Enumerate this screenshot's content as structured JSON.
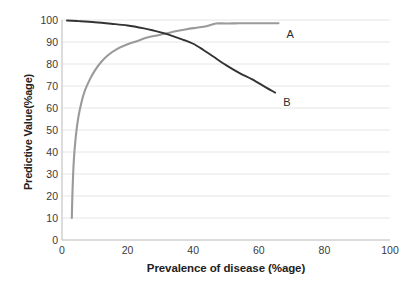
{
  "chart_data": {
    "type": "line",
    "title": "",
    "xlabel": "Prevalence of disease (%age)",
    "ylabel": "Predictive Value(%age)",
    "xlim": [
      0,
      100
    ],
    "ylim": [
      0,
      100
    ],
    "grid": "horizontal",
    "legend_position": "inline-end-of-line",
    "xticks": [
      0,
      20,
      40,
      60,
      80,
      100
    ],
    "yticks": [
      0,
      10,
      20,
      30,
      40,
      50,
      60,
      70,
      80,
      90,
      100
    ],
    "series": [
      {
        "name": "A",
        "label": "A",
        "color": "#9a9a9a",
        "description": "Positive predictive value rising with prevalence",
        "x": [
          3,
          3.2,
          3.6,
          4.2,
          5,
          6,
          7,
          8.5,
          10,
          12,
          14,
          17,
          20,
          23,
          26,
          29,
          32,
          35,
          38,
          41,
          44,
          47,
          50,
          54,
          58,
          62,
          66
        ],
        "y": [
          10,
          22,
          36,
          47,
          56,
          63,
          68,
          73,
          77,
          81,
          84,
          87,
          89,
          90.5,
          92,
          93,
          94,
          95,
          95.8,
          96.5,
          97.2,
          98.4,
          98.4,
          98.5,
          98.5,
          98.5,
          98.5
        ]
      },
      {
        "name": "B",
        "label": "B",
        "color": "#333333",
        "description": "Negative predictive value falling with prevalence",
        "x": [
          1.5,
          5,
          10,
          15,
          20,
          25,
          28,
          31,
          34,
          37,
          40,
          43,
          46,
          50,
          54,
          58,
          62,
          65
        ],
        "y": [
          99.8,
          99.5,
          99,
          98.3,
          97.5,
          96.2,
          95.2,
          94,
          92.6,
          91,
          89.2,
          86.5,
          83.5,
          79.5,
          76,
          73,
          69.5,
          67
        ]
      }
    ]
  },
  "axes": {
    "y_title": "Predictive Value(%age)",
    "x_title": "Prevalence of disease (%age)"
  },
  "colors": {
    "series_a": "#9a9a9a",
    "series_b": "#333333",
    "gridline": "#e6e6e6",
    "axis": "#b9b9b9",
    "background": "#ffffff",
    "text": "#3a3a3a"
  }
}
